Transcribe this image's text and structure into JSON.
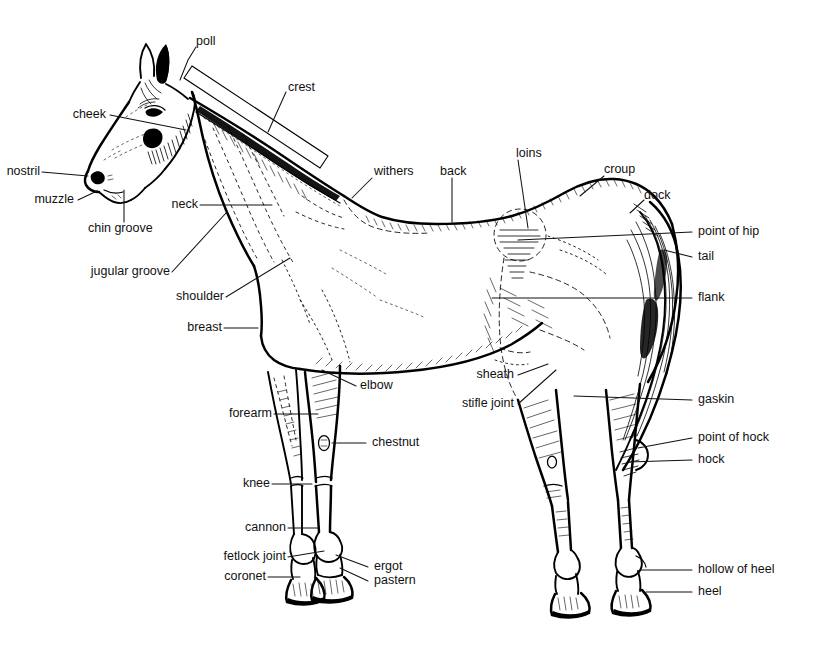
{
  "figure": {
    "background_color": "#ffffff",
    "ink_color": "#111111",
    "width": 826,
    "height": 650
  },
  "labels": {
    "poll": "poll",
    "crest": "crest",
    "cheek": "cheek",
    "nostril": "nostril",
    "muzzle": "muzzle",
    "chin_groove": "chin groove",
    "jugular_groove": "jugular groove",
    "neck": "neck",
    "shoulder": "shoulder",
    "breast": "breast",
    "withers": "withers",
    "back": "back",
    "loins": "loins",
    "croup": "croup",
    "dock": "dock",
    "point_of_hip": "point of hip",
    "tail": "tail",
    "flank": "flank",
    "elbow": "elbow",
    "forearm": "forearm",
    "chestnut": "chestnut",
    "knee": "knee",
    "cannon": "cannon",
    "fetlock_joint": "fetlock joint",
    "coronet": "coronet",
    "ergot": "ergot",
    "pastern": "pastern",
    "sheath": "sheath",
    "stifle_joint": "stifle joint",
    "gaskin": "gaskin",
    "point_of_hock": "point of hock",
    "hock": "hock",
    "hollow_of_heel": "hollow of heel",
    "heel": "heel"
  }
}
